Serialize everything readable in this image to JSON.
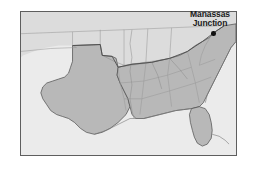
{
  "figure": {
    "kind": "historical-reference-map",
    "region_depicted": "Southern United States",
    "frame": {
      "border_color": "#5e5e5e",
      "background_color": "#e9e9e9"
    }
  },
  "map": {
    "water_color": "#ebebeb",
    "land_unshaded_color": "#dcdcdc",
    "land_shaded_color": "#b8b8b8",
    "border_line_color": "#8a8a8a",
    "coast_line_color": "#777777",
    "state_outline_color": "#9a9a9a",
    "region_outline_color": "#4a4a4a"
  },
  "annotations": {
    "markers": [
      {
        "id": "manassas-junction",
        "label_line_1": "Manassas",
        "label_line_2": "Junction",
        "marker_shape": "filled-circle",
        "marker_color": "#111111",
        "label_color": "#1b1b1b"
      }
    ]
  }
}
